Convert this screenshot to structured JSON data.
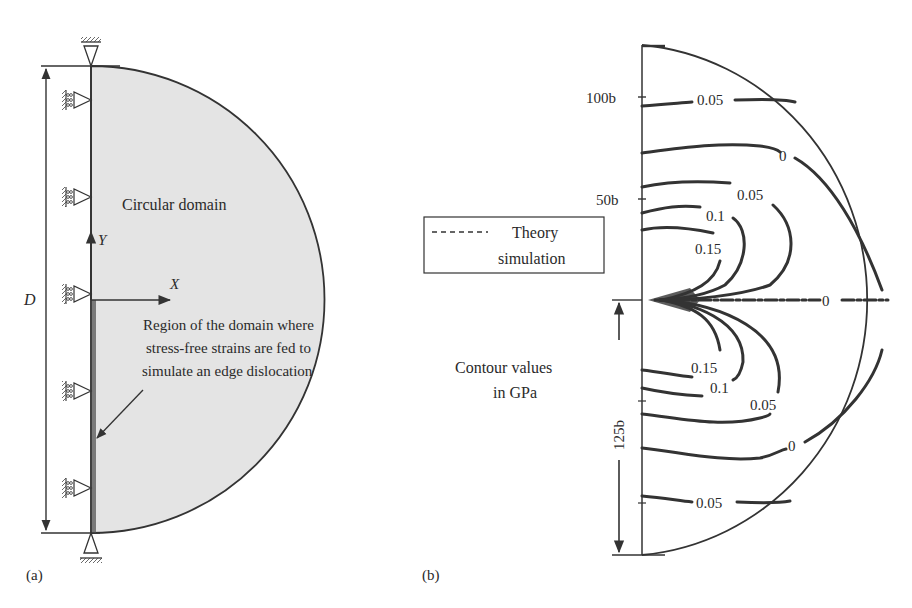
{
  "panel_a": {
    "tag": "(a)",
    "domain_label": "Circular domain",
    "axis_x": "X",
    "axis_y": "Y",
    "dimension_label": "D",
    "region_note": [
      "Region of the domain where",
      "stress-free strains are fed to",
      "simulate an edge dislocation"
    ],
    "domain_fill": "#e4e4e4",
    "strip_fill": "#7a7a7a",
    "roller_supports": 5,
    "pin_supports": 2
  },
  "panel_b": {
    "tag": "(b)",
    "legend": {
      "line_style": "dashed",
      "line1": "Theory",
      "line2": "simulation"
    },
    "note": [
      "Contour values",
      "in GPa"
    ],
    "y_ticks": [
      "100b",
      "50b"
    ],
    "dimension_label": "125b",
    "contour_labels": {
      "upper": [
        "0.05",
        "0",
        "0.05",
        "0.1",
        "0.15"
      ],
      "middle": [
        "0"
      ],
      "lower": [
        "0.15",
        "0.1",
        "0.05",
        "0",
        "0.05"
      ]
    },
    "units": "GPa"
  }
}
